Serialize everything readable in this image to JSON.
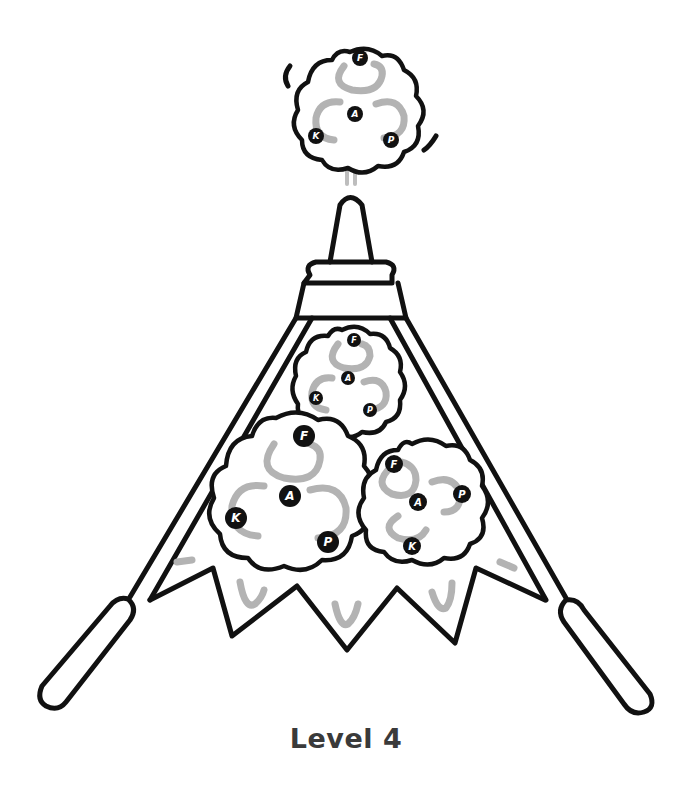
{
  "figure": {
    "caption": "Level 4",
    "colors": {
      "ink": "#111111",
      "arrow_grey": "#b3b3b3",
      "background": "#ffffff",
      "caption": "#3a3a3a"
    }
  },
  "clouds": {
    "top": {
      "F": "F",
      "A": "A",
      "K": "K",
      "P": "P"
    },
    "inner_top": {
      "F": "F",
      "A": "A",
      "K": "K",
      "P": "P"
    },
    "inner_left": {
      "F": "F",
      "A": "A",
      "K": "K",
      "P": "P"
    },
    "inner_right": {
      "F": "F",
      "A": "A",
      "K": "K",
      "P": "P"
    }
  }
}
